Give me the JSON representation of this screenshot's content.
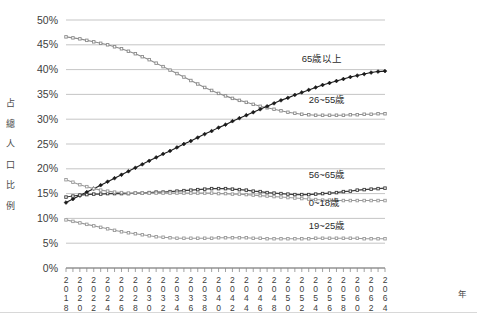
{
  "chart_data": {
    "type": "line",
    "title": "",
    "xlabel": "年",
    "ylabel": "占總人口比例",
    "ylabel_chars": [
      "占",
      "總",
      "人",
      "口",
      "比",
      "例"
    ],
    "ylim": [
      0,
      50
    ],
    "ytick_labels": [
      "0%",
      "5%",
      "10%",
      "15%",
      "20%",
      "25%",
      "30%",
      "35%",
      "40%",
      "45%",
      "50%"
    ],
    "ytick_values": [
      0,
      5,
      10,
      15,
      20,
      25,
      30,
      35,
      40,
      45,
      50
    ],
    "grid": true,
    "legend_position": "right-inline",
    "x_start": 2018,
    "x_end": 2064,
    "x_tick_step": 1,
    "x_label_step": 2,
    "xtick_labels": [
      "2018",
      "2020",
      "2022",
      "2024",
      "2026",
      "2028",
      "2030",
      "2032",
      "2034",
      "2036",
      "2038",
      "2040",
      "2042",
      "2044",
      "2046",
      "2048",
      "2050",
      "2052",
      "2054",
      "2056",
      "2058",
      "2060",
      "2062",
      "2064"
    ],
    "x": [
      2018,
      2019,
      2020,
      2021,
      2022,
      2023,
      2024,
      2025,
      2026,
      2027,
      2028,
      2029,
      2030,
      2031,
      2032,
      2033,
      2034,
      2035,
      2036,
      2037,
      2038,
      2039,
      2040,
      2041,
      2042,
      2043,
      2044,
      2045,
      2046,
      2047,
      2048,
      2049,
      2050,
      2051,
      2052,
      2053,
      2054,
      2055,
      2056,
      2057,
      2058,
      2059,
      2060,
      2061,
      2062,
      2063,
      2064
    ],
    "series": [
      {
        "name": "26~55歲",
        "color": "#8c8c8c",
        "marker": "square",
        "label_x": 2053,
        "label_y": 33.3,
        "values": [
          46.6,
          46.4,
          46.2,
          45.9,
          45.6,
          45.3,
          45.0,
          44.6,
          44.2,
          43.7,
          43.2,
          42.6,
          42.0,
          41.3,
          40.6,
          39.9,
          39.2,
          38.5,
          37.8,
          37.1,
          36.4,
          35.8,
          35.2,
          34.7,
          34.2,
          33.8,
          33.4,
          33.0,
          32.6,
          32.3,
          32.0,
          31.7,
          31.4,
          31.2,
          31.0,
          30.9,
          30.8,
          30.8,
          30.8,
          30.8,
          30.8,
          30.9,
          30.9,
          31.0,
          31.0,
          31.1,
          31.1
        ]
      },
      {
        "name": "65歲以上",
        "color": "#1a1a1a",
        "marker": "diamond",
        "label_x": 2052,
        "label_y": 41.6,
        "values": [
          13.2,
          13.9,
          14.6,
          15.3,
          16.0,
          16.7,
          17.4,
          18.1,
          18.8,
          19.5,
          20.2,
          20.9,
          21.6,
          22.3,
          23.0,
          23.6,
          24.3,
          25.0,
          25.6,
          26.3,
          27.0,
          27.6,
          28.3,
          28.9,
          29.6,
          30.2,
          30.8,
          31.4,
          32.0,
          32.6,
          33.2,
          33.8,
          34.3,
          34.9,
          35.4,
          35.9,
          36.4,
          36.9,
          37.3,
          37.7,
          38.1,
          38.5,
          38.8,
          39.1,
          39.4,
          39.6,
          39.7
        ]
      },
      {
        "name": "56~65歲",
        "color": "#3c3c3c",
        "marker": "square",
        "label_x": 2053,
        "label_y": 18.1,
        "values": [
          14.3,
          14.5,
          14.7,
          14.8,
          14.9,
          14.9,
          15.0,
          15.0,
          15.0,
          15.0,
          15.1,
          15.1,
          15.2,
          15.3,
          15.3,
          15.4,
          15.5,
          15.6,
          15.7,
          15.8,
          15.9,
          16.0,
          16.0,
          16.0,
          15.9,
          15.8,
          15.7,
          15.5,
          15.4,
          15.2,
          15.1,
          15.0,
          14.9,
          14.8,
          14.8,
          14.8,
          14.9,
          15.0,
          15.1,
          15.2,
          15.4,
          15.5,
          15.7,
          15.8,
          15.9,
          16.0,
          16.1
        ]
      },
      {
        "name": "0~18歲",
        "color": "#9a9a9a",
        "marker": "square",
        "label_x": 2053,
        "label_y": 12.6,
        "values": [
          17.8,
          17.3,
          16.8,
          16.4,
          16.0,
          15.7,
          15.5,
          15.3,
          15.2,
          15.1,
          15.1,
          15.1,
          15.1,
          15.1,
          15.1,
          15.1,
          15.1,
          15.1,
          15.1,
          15.1,
          15.1,
          15.1,
          15.0,
          15.0,
          14.9,
          14.9,
          14.8,
          14.7,
          14.6,
          14.5,
          14.4,
          14.3,
          14.2,
          14.1,
          14.0,
          13.9,
          13.8,
          13.7,
          13.7,
          13.6,
          13.6,
          13.6,
          13.6,
          13.6,
          13.6,
          13.6,
          13.6
        ]
      },
      {
        "name": "19~25歲",
        "color": "#9a9a9a",
        "marker": "square",
        "label_x": 2053,
        "label_y": 7.8,
        "values": [
          9.7,
          9.4,
          9.1,
          8.8,
          8.5,
          8.2,
          7.9,
          7.6,
          7.3,
          7.1,
          6.9,
          6.7,
          6.5,
          6.3,
          6.2,
          6.1,
          6.0,
          6.0,
          6.0,
          6.0,
          6.0,
          6.0,
          6.1,
          6.1,
          6.1,
          6.1,
          6.1,
          6.0,
          6.0,
          5.9,
          5.9,
          5.9,
          5.9,
          5.9,
          5.9,
          5.9,
          6.0,
          6.0,
          6.0,
          6.0,
          6.0,
          6.0,
          6.0,
          5.9,
          5.9,
          5.9,
          5.9
        ]
      }
    ]
  }
}
